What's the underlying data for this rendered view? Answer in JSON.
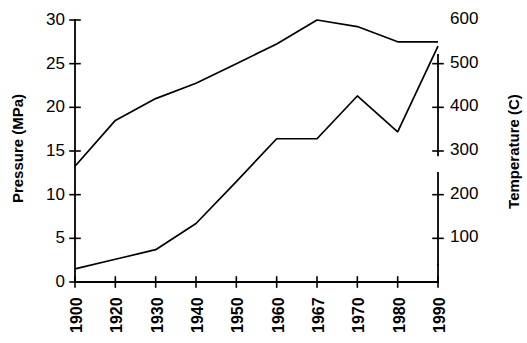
{
  "chart_data": {
    "type": "line",
    "title": "",
    "subtitle": "",
    "xlabel": "",
    "ylabel": "Pressure (MPa)",
    "y2label": "Temperature (C)",
    "grid": false,
    "legend": "none",
    "categories": [
      "1900",
      "1920",
      "1930",
      "1940",
      "1950",
      "1960",
      "1967",
      "1970",
      "1980",
      "1990"
    ],
    "x": [
      1900,
      1920,
      1930,
      1940,
      1950,
      1960,
      1967,
      1970,
      1980,
      1990
    ],
    "ylim": [
      0,
      30
    ],
    "y2lim": [
      0,
      600
    ],
    "yticks": [
      0,
      5,
      10,
      15,
      20,
      25,
      30
    ],
    "ytick_labels": [
      "0",
      "5",
      "10",
      "15",
      "20",
      "25",
      "30"
    ],
    "y2ticks": [
      100,
      200,
      300,
      400,
      500,
      600
    ],
    "y2tick_labels": [
      "100",
      "200",
      "300",
      "400",
      "500",
      "600"
    ],
    "series": [
      {
        "name": "Temperature (C)",
        "axis": "right",
        "unit": "C",
        "values": [
          265,
          370,
          420,
          455,
          500,
          545,
          600,
          585,
          550,
          550
        ]
      },
      {
        "name": "Pressure (MPa)",
        "axis": "left",
        "unit": "MPa",
        "values": [
          1.5,
          2.6,
          3.7,
          6.7,
          11.5,
          16.4,
          16.4,
          21.3,
          17.2,
          27.0
        ]
      }
    ]
  },
  "axes": {
    "left_title": "Pressure (MPa)",
    "right_title": "Temperature (C)"
  }
}
